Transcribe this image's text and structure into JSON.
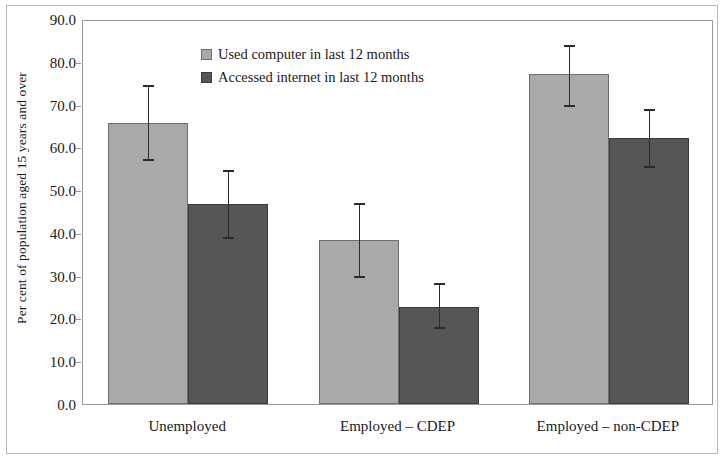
{
  "chart_data": {
    "type": "bar",
    "title": "",
    "subtitle": "",
    "xlabel": "",
    "ylabel": "Per cent of population aged 15 years and over",
    "ylim": [
      0.0,
      90.0
    ],
    "ytick_labels": [
      "0.0",
      "10.0",
      "20.0",
      "30.0",
      "40.0",
      "50.0",
      "60.0",
      "70.0",
      "80.0",
      "90.0"
    ],
    "ytick_values": [
      0,
      10,
      20,
      30,
      40,
      50,
      60,
      70,
      80,
      90
    ],
    "grid": false,
    "legend_position": "top-left inside plot",
    "error_bars": "95% confidence interval (vertical whiskers with caps)",
    "categories": [
      "Unemployed",
      "Employed – CDEP",
      "Employed – non-CDEP"
    ],
    "series": [
      {
        "name": "Used computer in last 12 months",
        "color": "#a9a9a9",
        "values": [
          65.7,
          38.3,
          77.1
        ],
        "err_low": [
          57.0,
          29.7,
          69.6
        ],
        "err_high": [
          74.3,
          46.7,
          83.6
        ]
      },
      {
        "name": "Accessed internet in last 12 months",
        "color": "#565656",
        "values": [
          46.7,
          22.7,
          62.2
        ],
        "err_low": [
          38.8,
          17.8,
          55.4
        ],
        "err_high": [
          54.4,
          28.0,
          68.7
        ]
      }
    ]
  },
  "legend": {
    "items": [
      {
        "label": "Used computer in last 12 months",
        "swatch": "light"
      },
      {
        "label": "Accessed internet in last 12 months",
        "swatch": "dark"
      }
    ]
  },
  "axis": {
    "y_title": "Per cent of population aged 15 years and over"
  }
}
